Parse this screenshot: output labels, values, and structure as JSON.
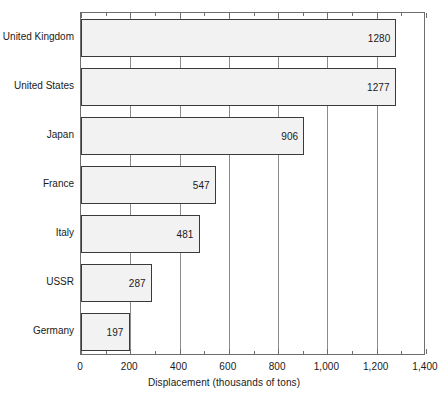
{
  "chart_data": {
    "type": "bar",
    "orientation": "horizontal",
    "title": "",
    "xlabel": "Displacement (thousands of tons)",
    "ylabel": "",
    "categories": [
      "United Kingdom",
      "United States",
      "Japan",
      "France",
      "Italy",
      "USSR",
      "Germany"
    ],
    "values": [
      1280,
      1277,
      906,
      547,
      481,
      287,
      197
    ],
    "value_labels": [
      "1280",
      "1277",
      "906",
      "547",
      "481",
      "287",
      "197"
    ],
    "xlim": [
      0,
      1400
    ],
    "xticks": [
      0,
      200,
      400,
      600,
      800,
      1000,
      1200,
      1400
    ],
    "xtick_labels": [
      "0",
      "200",
      "400",
      "600",
      "800",
      "1,000",
      "1,200",
      "1,400"
    ],
    "xtick_minor_step": 100,
    "grid": "vertical",
    "legend": null,
    "bar_fill_color": "#f2f2f2",
    "bar_border_color": "#3a3a3a",
    "grid_color": "#8c8c8c",
    "frame_color": "#6e6e6e",
    "text_color": "#1a1a1a",
    "background_color": "#ffffff"
  }
}
